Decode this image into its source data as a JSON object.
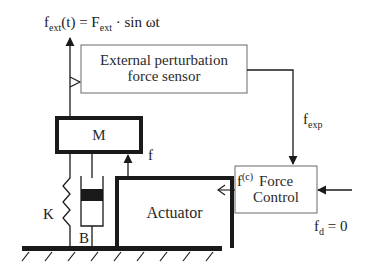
{
  "diagram": {
    "formula": {
      "f": "f",
      "f_sub": "ext",
      "mid": "(t) = F",
      "F_sub": "ext",
      "tail": " · sin ωt"
    },
    "blocks": {
      "sensor": {
        "line1": "External perturbation",
        "line2": "force sensor"
      },
      "mass": {
        "label": "M"
      },
      "actuator": {
        "label": "Actuator"
      },
      "force_control": {
        "line1": "Force",
        "line2": "Control"
      }
    },
    "labels": {
      "f_exp": {
        "main": "f",
        "sub": "exp"
      },
      "f": "f",
      "f_c": {
        "main": "f",
        "sup": "(c)"
      },
      "spring": "K",
      "damper": "B",
      "f_d": {
        "main": "f",
        "sub": "d",
        "tail": " = 0"
      }
    },
    "colors": {
      "ink": "#1a1a1a",
      "box_stroke": "#555555",
      "background": "#ffffff"
    }
  }
}
